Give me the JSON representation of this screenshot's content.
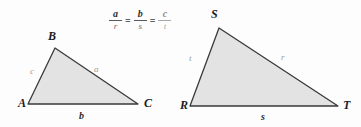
{
  "figure": {
    "background_color": "#fdfdfd",
    "triangle_fill": "#e3e3e3",
    "triangle_stroke": "#3a3a3a"
  },
  "equation": {
    "fraction_1": {
      "numerator": "a",
      "denominator": "r"
    },
    "equals_1": "=",
    "fraction_2": {
      "numerator": "b",
      "denominator": "s"
    },
    "equals_2": "=",
    "fraction_3": {
      "numerator": "c",
      "denominator": "t"
    }
  },
  "left_triangle": {
    "name": "triangle-ABC",
    "vertices": [
      {
        "label": "A",
        "x": 28,
        "y": 104
      },
      {
        "label": "B",
        "x": 55,
        "y": 48
      },
      {
        "label": "C",
        "x": 138,
        "y": 104
      }
    ],
    "sides": [
      {
        "label": "c",
        "between": "A-B",
        "style": "light"
      },
      {
        "label": "a",
        "between": "B-C",
        "style": "light"
      },
      {
        "label": "b",
        "between": "A-C",
        "style": "bold"
      }
    ]
  },
  "right_triangle": {
    "name": "triangle-RST",
    "vertices": [
      {
        "label": "R",
        "x": 190,
        "y": 106
      },
      {
        "label": "S",
        "x": 219,
        "y": 28
      },
      {
        "label": "T",
        "x": 338,
        "y": 106
      }
    ],
    "sides": [
      {
        "label": "t",
        "between": "R-S",
        "style": "light"
      },
      {
        "label": "r",
        "between": "S-T",
        "style": "light"
      },
      {
        "label": "s",
        "between": "R-T",
        "style": "bold"
      }
    ]
  }
}
